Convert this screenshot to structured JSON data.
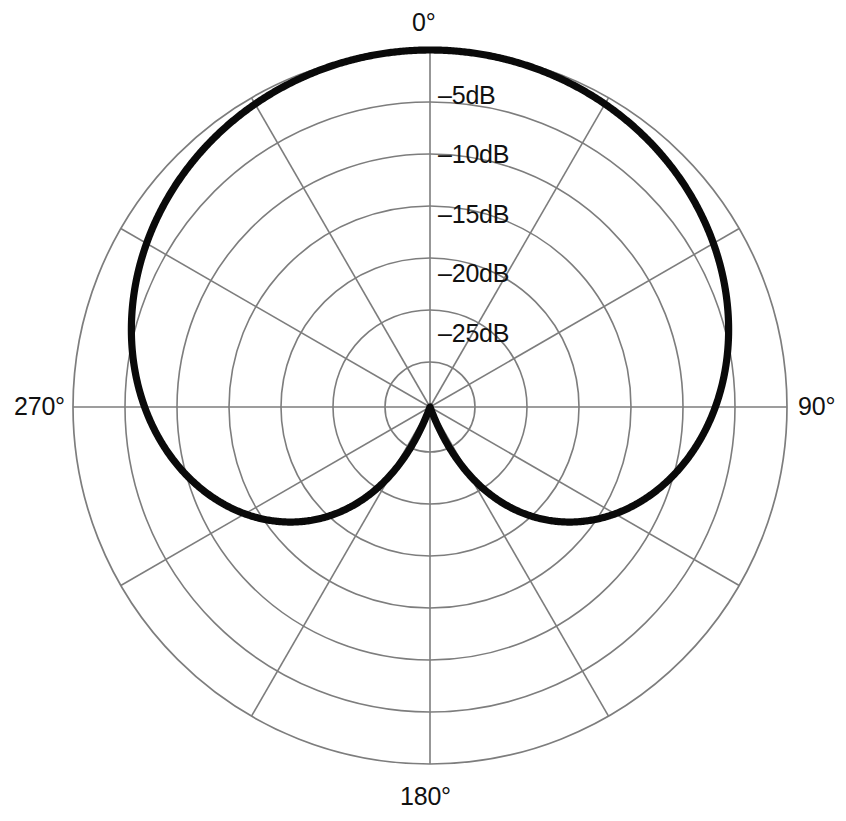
{
  "figure": {
    "title": "",
    "background": "#ffffff",
    "grid_color": "#7d7d7d",
    "curve_color": "#0a0a0a"
  },
  "angle_labels": {
    "deg_0": "0°",
    "deg_90": "90°",
    "deg_180": "180°",
    "deg_270": "270°"
  },
  "ring_labels": [
    {
      "text": "–5dB",
      "value": -5
    },
    {
      "text": "–10dB",
      "value": -10
    },
    {
      "text": "–15dB",
      "value": -15
    },
    {
      "text": "–20dB",
      "value": -20
    },
    {
      "text": "–25dB",
      "value": -25
    }
  ],
  "chart_data": {
    "type": "line",
    "subtype": "polar",
    "title": "",
    "xlabel": "",
    "ylabel": "",
    "theta_unit": "degrees",
    "r_unit": "dB",
    "rlim": [
      -30,
      0
    ],
    "r_ticks": [
      -5,
      -10,
      -15,
      -20,
      -25
    ],
    "r_tick_labels": [
      "–5dB",
      "–10dB",
      "–15dB",
      "–20dB",
      "–25dB"
    ],
    "theta_ticks": [
      0,
      30,
      60,
      90,
      120,
      150,
      180,
      210,
      240,
      270,
      300,
      330
    ],
    "theta_tick_labels": [
      "0°",
      "",
      "",
      "90°",
      "",
      "",
      "180°",
      "",
      "",
      "270°",
      "",
      ""
    ],
    "theta_zero_location": "N",
    "theta_direction": "clockwise",
    "grid": true,
    "legend": false,
    "series": [
      {
        "name": "Cardioid",
        "color": "#0a0a0a",
        "formula_linear": "r = 0.5 * (1 + cos(theta))",
        "formula_db": "dB = 20 * log10(0.5 * (1 + cos(theta)))",
        "theta": [
          0,
          10,
          20,
          30,
          40,
          50,
          60,
          70,
          80,
          90,
          100,
          110,
          120,
          130,
          140,
          150,
          160,
          170,
          175,
          180,
          185,
          190,
          200,
          210,
          220,
          230,
          240,
          250,
          260,
          270,
          280,
          290,
          300,
          310,
          320,
          330,
          340,
          350,
          360
        ],
        "values_db": [
          0,
          -0.07,
          -0.27,
          -0.62,
          -1.11,
          -1.76,
          -2.5,
          -3.5,
          -4.6,
          -6.0,
          -7.6,
          -9.5,
          -12.0,
          -15.0,
          -18.8,
          -23.5,
          -30.0,
          -40.0,
          -47.0,
          -60.0,
          -47.0,
          -40.0,
          -30.0,
          -23.5,
          -18.8,
          -15.0,
          -12.0,
          -9.5,
          -7.6,
          -6.0,
          -4.6,
          -3.5,
          -2.5,
          -1.76,
          -1.11,
          -0.62,
          -0.27,
          -0.07,
          0
        ]
      }
    ]
  }
}
